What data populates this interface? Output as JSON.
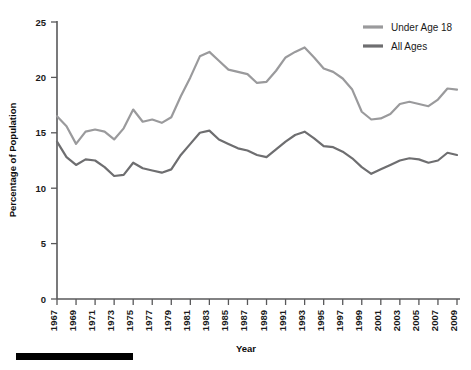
{
  "chart_data": {
    "type": "line",
    "title": "",
    "xlabel": "Year",
    "ylabel": "Percentage of Population",
    "xlim": [
      1967,
      2009
    ],
    "ylim": [
      0,
      25
    ],
    "grid": false,
    "legend_position": "top-right",
    "xticks": [
      1967,
      1969,
      1971,
      1973,
      1975,
      1977,
      1979,
      1981,
      1983,
      1985,
      1987,
      1989,
      1991,
      1993,
      1995,
      1997,
      1999,
      2001,
      2003,
      2005,
      2007,
      2009
    ],
    "yticks": [
      0,
      5,
      10,
      15,
      20,
      25
    ],
    "x": [
      1967,
      1968,
      1969,
      1970,
      1971,
      1972,
      1973,
      1974,
      1975,
      1976,
      1977,
      1978,
      1979,
      1980,
      1981,
      1982,
      1983,
      1984,
      1985,
      1986,
      1987,
      1988,
      1989,
      1990,
      1991,
      1992,
      1993,
      1994,
      1995,
      1996,
      1997,
      1998,
      1999,
      2000,
      2001,
      2002,
      2003,
      2004,
      2005,
      2006,
      2007,
      2008,
      2009
    ],
    "series": [
      {
        "name": "Under Age 18",
        "color": "#9a9a9c",
        "values": [
          16.5,
          15.6,
          14.0,
          15.1,
          15.3,
          15.1,
          14.4,
          15.4,
          17.1,
          16.0,
          16.2,
          15.9,
          16.4,
          18.3,
          20.0,
          21.9,
          22.3,
          21.5,
          20.7,
          20.5,
          20.3,
          19.5,
          19.6,
          20.6,
          21.8,
          22.3,
          22.7,
          21.8,
          20.8,
          20.5,
          19.9,
          18.9,
          16.9,
          16.2,
          16.3,
          16.7,
          17.6,
          17.8,
          17.6,
          17.4,
          18.0,
          19.0,
          18.9
        ]
      },
      {
        "name": "All Ages",
        "color": "#6e6e70",
        "values": [
          14.2,
          12.8,
          12.1,
          12.6,
          12.5,
          11.9,
          11.1,
          11.2,
          12.3,
          11.8,
          11.6,
          11.4,
          11.7,
          13.0,
          14.0,
          15.0,
          15.2,
          14.4,
          14.0,
          13.6,
          13.4,
          13.0,
          12.8,
          13.5,
          14.2,
          14.8,
          15.1,
          14.5,
          13.8,
          13.7,
          13.3,
          12.7,
          11.9,
          11.3,
          11.7,
          12.1,
          12.5,
          12.7,
          12.6,
          12.3,
          12.5,
          13.2,
          13.0
        ]
      }
    ]
  },
  "legend": {
    "items": [
      {
        "label": "Under Age 18",
        "color": "#9a9a9c"
      },
      {
        "label": "All Ages",
        "color": "#6e6e70"
      }
    ]
  },
  "axes": {
    "x_title": "Year",
    "y_title": "Percentage of Population"
  }
}
